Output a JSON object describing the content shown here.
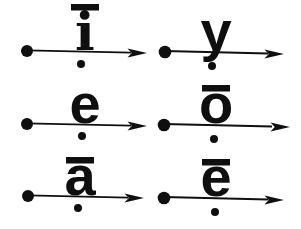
{
  "colors": {
    "ink": "#0f0f0f",
    "background": "#ffffff"
  },
  "cells": [
    {
      "letter": "i",
      "display": "ī",
      "has_macron": true
    },
    {
      "letter": "y",
      "display": "y",
      "has_macron": false
    },
    {
      "letter": "e",
      "display": "e",
      "has_macron": false
    },
    {
      "letter": "o",
      "display": "ō",
      "has_macron": true
    },
    {
      "letter": "a",
      "display": "ā",
      "has_macron": true
    },
    {
      "letter": "e",
      "display": "ē",
      "has_macron": true
    }
  ]
}
